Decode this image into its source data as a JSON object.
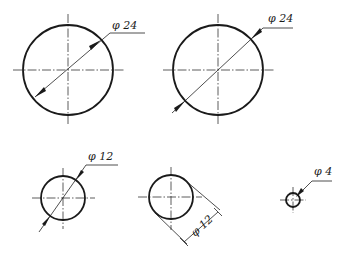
{
  "figure": {
    "views": [
      {
        "id": "circle-1",
        "diameter_label": "φ 24",
        "dimension_style": "leader-through-center"
      },
      {
        "id": "circle-2",
        "diameter_label": "φ 24",
        "dimension_style": "leader-through-center-extended"
      },
      {
        "id": "circle-3",
        "diameter_label": "φ 12",
        "dimension_style": "leader-through-center-arrows-outside"
      },
      {
        "id": "circle-4",
        "diameter_label": "φ 12",
        "dimension_style": "tangent-extension-lines"
      },
      {
        "id": "circle-5",
        "diameter_label": "φ 4",
        "dimension_style": "small-circle-leader"
      }
    ]
  }
}
